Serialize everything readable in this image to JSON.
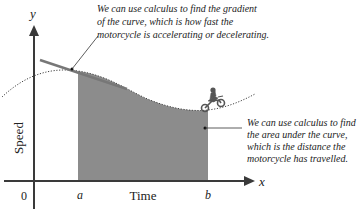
{
  "diagram": {
    "axes": {
      "y_label": "y",
      "x_label": "x",
      "y_title": "Speed",
      "x_title": "Time",
      "origin_label": "0",
      "a_label": "a",
      "b_label": "b"
    },
    "annotations": {
      "gradient": [
        "We can use calculus to find the gradient",
        "of the curve, which is how fast the",
        "motorcycle is accelerating or decelerating."
      ],
      "area": [
        "We can use calculus to find",
        "the area under the curve,",
        "which is the distance the",
        "motorcycle has travelled."
      ]
    },
    "icons": {
      "motorcycle": "motorcycle-rider-icon"
    },
    "colors": {
      "axis": "#3a3a3a",
      "shade": "#8c8c8c",
      "tangent": "#777777",
      "text": "#222222"
    }
  }
}
